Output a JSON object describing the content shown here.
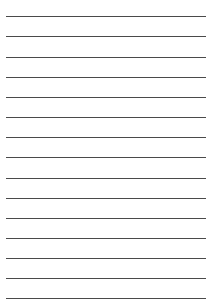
{
  "page": {
    "type": "lined-paper",
    "background_color": "#ffffff",
    "line_color": "#4a4a4a",
    "line_count": 15,
    "line_left_x": 6,
    "line_right_x": 206,
    "first_line_y": 16,
    "line_spacing": 20.15,
    "lines": [
      {
        "y": 16,
        "text": ""
      },
      {
        "y": 36,
        "text": ""
      },
      {
        "y": 56.5,
        "text": ""
      },
      {
        "y": 76.5,
        "text": ""
      },
      {
        "y": 97,
        "text": ""
      },
      {
        "y": 117,
        "text": ""
      },
      {
        "y": 137,
        "text": ""
      },
      {
        "y": 157,
        "text": ""
      },
      {
        "y": 177.5,
        "text": ""
      },
      {
        "y": 197.5,
        "text": ""
      },
      {
        "y": 218,
        "text": ""
      },
      {
        "y": 238,
        "text": ""
      },
      {
        "y": 258,
        "text": ""
      },
      {
        "y": 278,
        "text": ""
      },
      {
        "y": 298,
        "text": ""
      }
    ]
  }
}
